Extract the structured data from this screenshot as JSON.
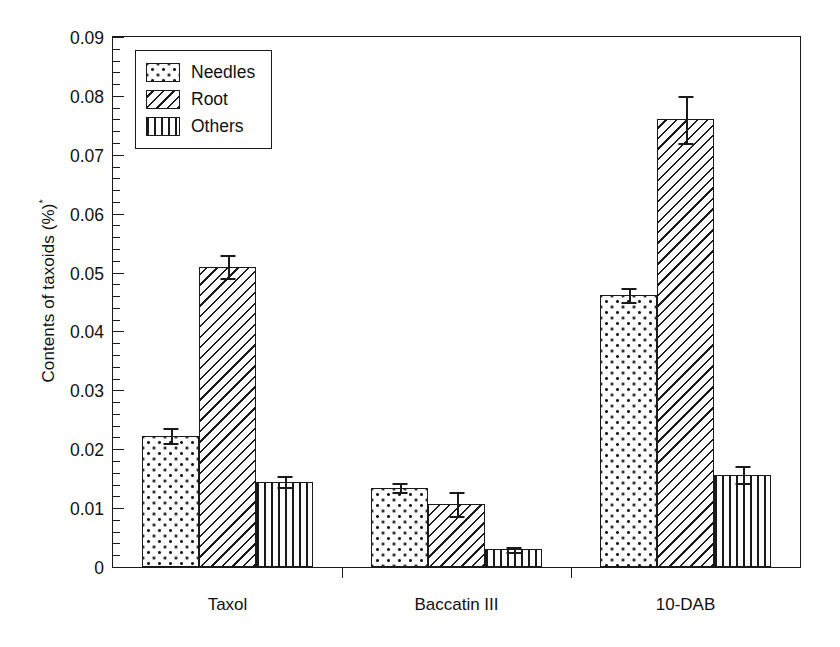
{
  "chart_data": {
    "type": "bar",
    "title": "",
    "xlabel": "",
    "ylabel": "Contents of taxoids (%)",
    "ylabel_superscript": "*",
    "categories": [
      "Taxol",
      "Baccatin III",
      "10-DAB"
    ],
    "ylim": [
      0,
      0.09
    ],
    "ytick_labels": [
      "0",
      "0.01",
      "0.02",
      "0.03",
      "0.04",
      "0.05",
      "0.06",
      "0.07",
      "0.08",
      "0.09"
    ],
    "ytick_values": [
      0,
      0.01,
      0.02,
      0.03,
      0.04,
      0.05,
      0.06,
      0.07,
      0.08,
      0.09
    ],
    "minor_tick_step": 0.002,
    "grid": false,
    "legend_position": "top-left",
    "series": [
      {
        "name": "Needles",
        "pattern": "dotted",
        "values": [
          0.0223,
          0.0135,
          0.0462
        ],
        "errors": [
          0.0013,
          0.0008,
          0.0012
        ]
      },
      {
        "name": "Root",
        "pattern": "diagonal-hatch",
        "values": [
          0.051,
          0.0107,
          0.076
        ],
        "errors": [
          0.002,
          0.0021,
          0.004
        ]
      },
      {
        "name": "Others",
        "pattern": "vertical-lines",
        "values": [
          0.0145,
          0.003,
          0.0157
        ],
        "errors": [
          0.0009,
          0.0004,
          0.0015
        ]
      }
    ]
  },
  "colors": {
    "foreground": "#1a1a1a",
    "background": "#ffffff",
    "bar_fill": "#fdfdfd"
  }
}
